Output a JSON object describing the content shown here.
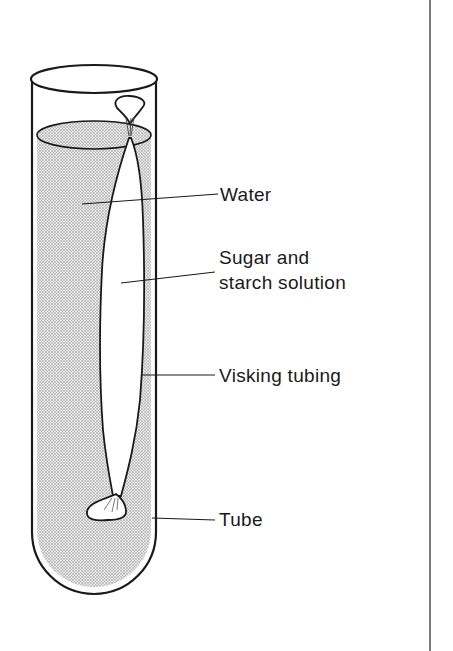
{
  "diagram": {
    "type": "labelled apparatus diagram",
    "labels": {
      "water": "Water",
      "solution_line1": "Sugar and",
      "solution_line2": "starch solution",
      "visking": "Visking tubing",
      "tube": "Tube"
    },
    "colors": {
      "line": "#1a1a1a",
      "water_fill": "#cfcfcf",
      "background": "#ffffff"
    }
  }
}
